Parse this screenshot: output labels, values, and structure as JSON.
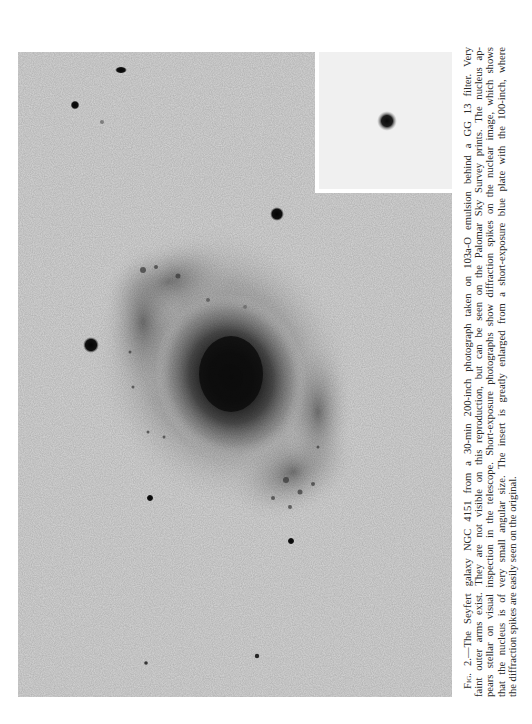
{
  "figure": {
    "label": "Fig. 2.",
    "caption_lines": [
      "—The Seyfert galaxy NGC 4151 from a 30-min 200-inch photograph taken on 103a-O emulsion behind a GG 13 filter. Very",
      "faint outer arms exist. They are not visible on this reproduction, but can be seen on the Palomar Sky Survey prints. The nucleus ap-",
      "pears stellar on visual inspection in the telescope. Short-exposure photographs show diffraction spikes on the nuclear image, which shows",
      "that the nucleus is of very small angular size. The insert is greatly enlarged from a short-exposure blue plate with the 100-inch, where",
      "the diffraction spikes are easily seen on the original."
    ],
    "subject": "Seyfert galaxy NGC 4151",
    "colors": {
      "sky_background": "#d6d6d6",
      "inset_background": "#f0f0f0",
      "caption_text": "#2a2a2a"
    }
  },
  "photo": {
    "stars": [
      {
        "x": 103,
        "y": 18,
        "rx": 6,
        "ry": 3.5
      },
      {
        "x": 57,
        "y": 53,
        "rx": 4.5,
        "ry": 4.5
      },
      {
        "x": 84,
        "y": 70,
        "rx": 2,
        "ry": 2
      },
      {
        "x": 259,
        "y": 162,
        "rx": 7,
        "ry": 7
      },
      {
        "x": 73,
        "y": 293,
        "rx": 8,
        "ry": 8
      },
      {
        "x": 132,
        "y": 446,
        "rx": 3.5,
        "ry": 3.5
      },
      {
        "x": 273,
        "y": 489,
        "rx": 3.5,
        "ry": 3.5
      },
      {
        "x": 128,
        "y": 611,
        "rx": 1.8,
        "ry": 1.8
      },
      {
        "x": 239,
        "y": 604,
        "rx": 2.2,
        "ry": 2.2
      }
    ],
    "inset_nucleus": {
      "x": 72,
      "y": 69,
      "r": 6
    }
  }
}
